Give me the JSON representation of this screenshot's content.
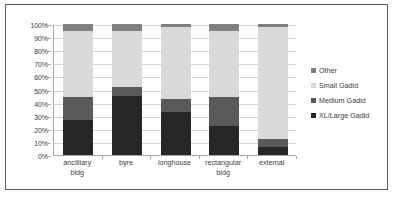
{
  "chart_data": {
    "type": "bar",
    "title": "",
    "subtitle": "",
    "xlabel": "",
    "ylabel": "",
    "stacked": true,
    "percent_stacked": true,
    "grid": true,
    "legend_position": "right",
    "ylim": [
      0,
      100
    ],
    "ytick_labels": [
      "0%",
      "10%",
      "20%",
      "30%",
      "40%",
      "50%",
      "60%",
      "70%",
      "80%",
      "90%",
      "100%"
    ],
    "ytick_values": [
      0,
      10,
      20,
      30,
      40,
      50,
      60,
      70,
      80,
      90,
      100
    ],
    "categories": [
      "ancilliary bldg",
      "byre",
      "longhouse",
      "rectangular bldg",
      "external"
    ],
    "category_lines": [
      [
        "ancilliary",
        "bldg"
      ],
      [
        "byre"
      ],
      [
        "longhouse"
      ],
      [
        "rectangular",
        "bldg"
      ],
      [
        "external"
      ]
    ],
    "series": [
      {
        "name": "XL/Large Gadid",
        "color": "#262626",
        "values": [
          27,
          45,
          33,
          22,
          6
        ]
      },
      {
        "name": "Medium Gadid",
        "color": "#595959",
        "values": [
          17,
          7,
          9.5,
          22,
          6
        ]
      },
      {
        "name": "Small Gadid",
        "color": "#d9d9d9",
        "values": [
          51,
          43,
          55,
          51,
          86
        ]
      },
      {
        "name": "Other",
        "color": "#808080",
        "values": [
          5,
          5,
          2.5,
          5,
          2
        ]
      }
    ]
  },
  "legend": {
    "items": [
      {
        "label": "Other",
        "color": "#808080"
      },
      {
        "label": "Small Gadid",
        "color": "#d9d9d9"
      },
      {
        "label": "Medium Gadid",
        "color": "#595959"
      },
      {
        "label": "XL/Large Gadid",
        "color": "#262626"
      }
    ]
  },
  "style": {
    "border_color": "#5a5a5a",
    "gridline_color": "#d4d4d4",
    "axis_color": "#a6a6a6",
    "text_color": "#3b3b3b",
    "background": "#ffffff"
  }
}
